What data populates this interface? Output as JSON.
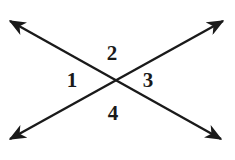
{
  "figure": {
    "background_color": "#ffffff",
    "stroke_color": "#1a1a1a",
    "stroke_width": 2.4,
    "width": 235,
    "height": 160,
    "intersection": {
      "x": 113,
      "y": 80
    },
    "lines": [
      {
        "name": "line-nw-se",
        "description": "double-headed line running from upper-left to lower-right",
        "x1": 10,
        "y1": 21,
        "x2": 221,
        "y2": 139,
        "arrow_start": true,
        "arrow_end": true
      },
      {
        "name": "line-sw-ne",
        "description": "double-headed line running from lower-left to upper-right",
        "x1": 10,
        "y1": 139,
        "x2": 223,
        "y2": 21,
        "arrow_start": true,
        "arrow_end": true
      }
    ],
    "labels": [
      {
        "id": "1",
        "text": "1",
        "position": "left",
        "x": 72,
        "y": 81
      },
      {
        "id": "2",
        "text": "2",
        "position": "top",
        "x": 112,
        "y": 54
      },
      {
        "id": "3",
        "text": "3",
        "position": "right",
        "x": 148,
        "y": 81
      },
      {
        "id": "4",
        "text": "4",
        "position": "bottom",
        "x": 113,
        "y": 114
      }
    ]
  }
}
